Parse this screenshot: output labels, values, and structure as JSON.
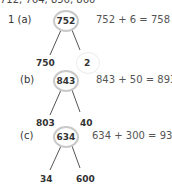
{
  "top_line": "712, 764, 856, 860",
  "problems": [
    {
      "label": "1 (a)",
      "whole": "752",
      "left": "750",
      "right": "2",
      "equation": "752 + 6 = 758"
    },
    {
      "label": "(b)",
      "whole": "843",
      "left": "803",
      "right": "40",
      "equation": "843 + 50 = 893"
    },
    {
      "label": "(c)",
      "whole": "634",
      "left": "34",
      "right": "600",
      "equation": "634 + 300 = 934"
    }
  ]
}
